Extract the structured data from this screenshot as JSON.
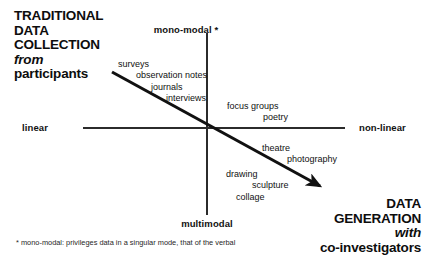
{
  "diagram": {
    "title_left": {
      "lines": [
        "TRADITIONAL",
        "DATA",
        "COLLECTION"
      ],
      "emphasis": "from",
      "last_line": "participants"
    },
    "title_right": {
      "lines": [
        "DATA",
        "GENERATION"
      ],
      "emphasis": "with",
      "last_line": "co-investigators"
    },
    "axes": {
      "x_left_label": "linear",
      "x_right_label": "non-linear",
      "y_top_label": "mono-modal *",
      "y_bottom_label": "multimodal"
    },
    "quadrant_items": {
      "traditional": [
        "surveys",
        "observation notes",
        "journals",
        "interviews"
      ],
      "focus": [
        "focus groups",
        "poetry"
      ],
      "performative": [
        "theatre",
        "photography"
      ],
      "arts": [
        "drawing",
        "sculpture",
        "collage"
      ]
    },
    "footnote": "* mono-modal: privileges data in a singular mode, that of the verbal",
    "colors": {
      "axis": "#2b2b2b",
      "arrow": "#111111",
      "text": "#111111",
      "background": "#ffffff"
    }
  }
}
